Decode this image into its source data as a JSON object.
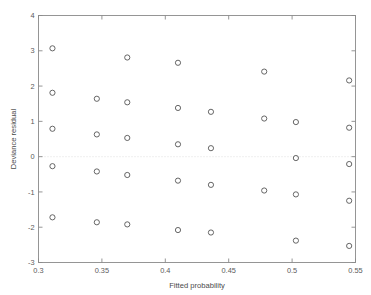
{
  "chart_data": {
    "type": "scatter",
    "title": "",
    "xlabel": "Fitted probability",
    "ylabel": "Deviance residual",
    "xlim": [
      0.3,
      0.55
    ],
    "ylim": [
      -3,
      4
    ],
    "xticks": [
      0.3,
      0.35,
      0.4,
      0.45,
      0.5,
      0.55
    ],
    "xtick_labels": [
      "0.3",
      "0.35",
      "0.4",
      "0.45",
      "0.5",
      "0.55"
    ],
    "yticks": [
      -3,
      -2,
      -1,
      0,
      1,
      2,
      3,
      4
    ],
    "ytick_labels": [
      "-3",
      "-2",
      "-1",
      "0",
      "1",
      "2",
      "3",
      "4"
    ],
    "grid": false,
    "legend": "none",
    "marker": "open-circle",
    "marker_color": "#555555",
    "reference_line": {
      "orientation": "horizontal",
      "value": 0,
      "style": "dotted",
      "color": "#d9d9d9"
    },
    "points": [
      {
        "x": 0.311,
        "y": 3.07
      },
      {
        "x": 0.311,
        "y": 1.81
      },
      {
        "x": 0.311,
        "y": 0.79
      },
      {
        "x": 0.311,
        "y": -0.27
      },
      {
        "x": 0.311,
        "y": -1.72
      },
      {
        "x": 0.346,
        "y": 1.64
      },
      {
        "x": 0.346,
        "y": 0.63
      },
      {
        "x": 0.346,
        "y": -0.42
      },
      {
        "x": 0.346,
        "y": -1.86
      },
      {
        "x": 0.37,
        "y": 2.81
      },
      {
        "x": 0.37,
        "y": 1.54
      },
      {
        "x": 0.37,
        "y": 0.53
      },
      {
        "x": 0.37,
        "y": -0.52
      },
      {
        "x": 0.37,
        "y": -1.92
      },
      {
        "x": 0.41,
        "y": 2.66
      },
      {
        "x": 0.41,
        "y": 1.38
      },
      {
        "x": 0.41,
        "y": 0.35
      },
      {
        "x": 0.41,
        "y": -0.68
      },
      {
        "x": 0.41,
        "y": -2.08
      },
      {
        "x": 0.436,
        "y": 1.27
      },
      {
        "x": 0.436,
        "y": 0.24
      },
      {
        "x": 0.436,
        "y": -0.8
      },
      {
        "x": 0.436,
        "y": -2.15
      },
      {
        "x": 0.478,
        "y": 2.41
      },
      {
        "x": 0.478,
        "y": 1.08
      },
      {
        "x": 0.478,
        "y": -0.96
      },
      {
        "x": 0.503,
        "y": 0.98
      },
      {
        "x": 0.503,
        "y": -0.04
      },
      {
        "x": 0.503,
        "y": -1.07
      },
      {
        "x": 0.503,
        "y": -2.38
      },
      {
        "x": 0.545,
        "y": 2.16
      },
      {
        "x": 0.545,
        "y": 0.82
      },
      {
        "x": 0.545,
        "y": -0.21
      },
      {
        "x": 0.545,
        "y": -1.25
      },
      {
        "x": 0.545,
        "y": -2.53
      }
    ]
  }
}
